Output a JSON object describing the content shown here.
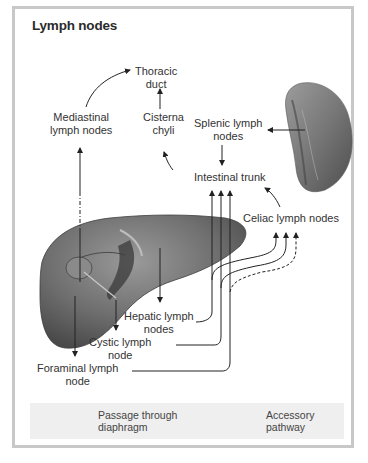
{
  "title": "Lymph nodes",
  "labels": {
    "thoracic_duct": [
      "Thoracic",
      "duct"
    ],
    "mediastinal": [
      "Mediastinal",
      "lymph nodes"
    ],
    "cisterna": [
      "Cisterna",
      "chyli"
    ],
    "splenic": [
      "Splenic lymph",
      "nodes"
    ],
    "intestinal_trunk": "Intestinal trunk",
    "celiac": "Celiac lymph nodes",
    "hepatic": [
      "Hepatic lymph",
      "nodes"
    ],
    "cystic": [
      "Cystic lymph",
      "node"
    ],
    "foraminal": [
      "Foraminal lymph",
      "node"
    ]
  },
  "legend": {
    "items": [
      {
        "line_style": "dash-dot",
        "label": [
          "Passage through",
          "diaphragm"
        ]
      },
      {
        "line_style": "dashed",
        "label": [
          "Accessory",
          "pathway"
        ]
      }
    ]
  },
  "colors": {
    "frame": "#c8c8c8",
    "legend_bg": "#efefef",
    "organ": "#7a7a7a",
    "line": "#333333"
  }
}
